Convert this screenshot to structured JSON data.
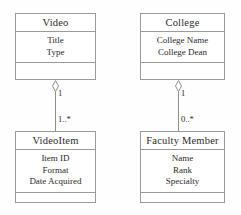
{
  "diagram": {
    "type": "uml-class-diagram",
    "classes": [
      {
        "id": "video",
        "name": "Video",
        "attributes": [
          "Title",
          "Type"
        ],
        "operations": []
      },
      {
        "id": "college",
        "name": "College",
        "attributes": [
          "College Name",
          "College Dean"
        ],
        "operations": []
      },
      {
        "id": "videoitem",
        "name": "VideoItem",
        "attributes": [
          "Item ID",
          "Format",
          "Date Acquired"
        ],
        "operations": []
      },
      {
        "id": "faculty_member",
        "name": "Faculty Member",
        "attributes": [
          "Name",
          "Rank",
          "Specialty"
        ],
        "operations": []
      }
    ],
    "relationships": [
      {
        "id": "video-videoitem",
        "kind": "aggregation",
        "whole": "Video",
        "part": "VideoItem",
        "whole_multiplicity": "1",
        "part_multiplicity": "1..*"
      },
      {
        "id": "college-faculty",
        "kind": "aggregation",
        "whole": "College",
        "part": "Faculty Member",
        "whole_multiplicity": "1",
        "part_multiplicity": "0..*"
      }
    ],
    "colors": {
      "line": "#9a9a9a",
      "text": "#2a2a2a",
      "background": "#fefefe",
      "box_fill": "#ffffff"
    }
  }
}
